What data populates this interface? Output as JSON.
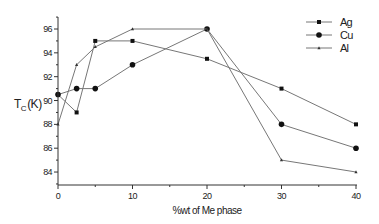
{
  "chart_data": {
    "type": "line",
    "title": "",
    "xlabel": "%wt of Me phase",
    "ylabel": "T_C (K)",
    "ylabel_main": "T",
    "ylabel_sub": "C",
    "ylabel_unit": "(K)",
    "xlim": [
      0,
      40
    ],
    "ylim": [
      83,
      97
    ],
    "x_ticks": [
      0,
      10,
      20,
      30,
      40
    ],
    "x_tick_labels": [
      "0",
      "10",
      "20",
      "30",
      "40"
    ],
    "y_ticks": [
      84,
      86,
      88,
      90,
      92,
      94,
      96
    ],
    "y_tick_labels": [
      "84",
      "86",
      "88",
      "90",
      "92",
      "94",
      "96"
    ],
    "grid": false,
    "legend_position": "upper right",
    "x": [
      0,
      2.5,
      5,
      10,
      20,
      30,
      40
    ],
    "series": [
      {
        "name": "Ag",
        "marker": "square",
        "values": [
          90.5,
          89,
          95,
          95,
          93.5,
          91,
          88
        ]
      },
      {
        "name": "Cu",
        "marker": "circle",
        "values": [
          90.5,
          91,
          91,
          93,
          96,
          88,
          86
        ]
      },
      {
        "name": "Al",
        "marker": "small-triangle",
        "values": [
          88,
          93,
          94.5,
          96,
          96,
          85,
          84
        ]
      }
    ]
  },
  "colors": {
    "axis": "#333333",
    "line": "#777777",
    "marker": "#111111",
    "background": "#ffffff"
  }
}
